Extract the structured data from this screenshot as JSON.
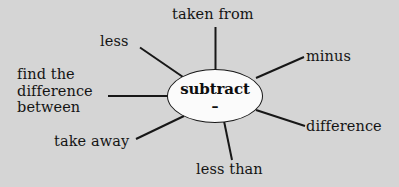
{
  "diagram": {
    "type": "word-web",
    "background_color": "#d5d5d5",
    "center": {
      "word": "subtract",
      "symbol": "–",
      "shape": "ellipse",
      "fill_color": "#fbfbfb",
      "stroke_color": "#171717"
    },
    "branches": [
      {
        "id": "taken-from",
        "label": "taken from",
        "position": "top"
      },
      {
        "id": "less",
        "label": "less",
        "position": "top-left"
      },
      {
        "id": "minus",
        "label": "minus",
        "position": "top-right"
      },
      {
        "id": "find-the-difference-between",
        "label": "find the difference between",
        "position": "left"
      },
      {
        "id": "difference",
        "label": "difference",
        "position": "bottom-right"
      },
      {
        "id": "take-away",
        "label": "take away",
        "position": "bottom-left"
      },
      {
        "id": "less-than",
        "label": "less than",
        "position": "bottom"
      }
    ],
    "connector_color": "#171717"
  }
}
